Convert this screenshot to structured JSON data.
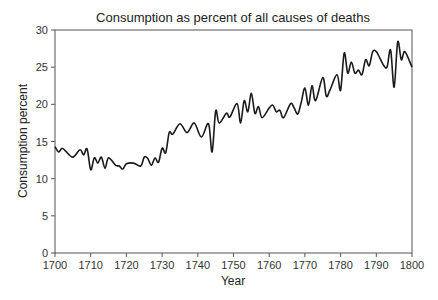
{
  "chart_data": {
    "type": "line",
    "title": "Consumption as percent of all causes of deaths",
    "xlabel": "Year",
    "ylabel": "Consumption percent",
    "xlim": [
      1700,
      1800
    ],
    "ylim": [
      0,
      30
    ],
    "xticks": [
      1700,
      1710,
      1720,
      1730,
      1740,
      1750,
      1760,
      1770,
      1780,
      1790,
      1800
    ],
    "yticks": [
      0,
      5,
      10,
      15,
      20,
      25,
      30
    ],
    "grid": false,
    "legend": null,
    "line_color": "#1a1a1a",
    "series": [
      {
        "name": "Consumption percent",
        "x": [
          1700,
          1701,
          1702,
          1703,
          1705,
          1707,
          1708,
          1709,
          1710,
          1711,
          1712,
          1713,
          1714,
          1715,
          1717,
          1718,
          1719,
          1720,
          1722,
          1724,
          1725,
          1726,
          1727,
          1728,
          1729,
          1730,
          1731,
          1732,
          1733,
          1735,
          1737,
          1739,
          1741,
          1743,
          1744,
          1745,
          1746,
          1748,
          1749,
          1751,
          1752,
          1753,
          1754,
          1755,
          1756,
          1757,
          1758,
          1760,
          1761,
          1762,
          1763,
          1764,
          1766,
          1767,
          1768,
          1769,
          1770,
          1771,
          1772,
          1773,
          1775,
          1776,
          1777,
          1779,
          1780,
          1781,
          1782,
          1783,
          1784,
          1785,
          1786,
          1787,
          1788,
          1789,
          1790,
          1791,
          1792,
          1793,
          1794,
          1795,
          1796,
          1797,
          1798,
          1800
        ],
        "values": [
          14.3,
          13.6,
          14.1,
          13.7,
          12.9,
          13.9,
          13.2,
          14.0,
          11.2,
          12.8,
          12.1,
          12.9,
          11.4,
          12.8,
          11.8,
          11.7,
          11.3,
          12.0,
          12.1,
          11.7,
          12.9,
          12.7,
          11.8,
          12.8,
          12.2,
          14.1,
          13.5,
          16.2,
          16.0,
          17.4,
          16.2,
          17.5,
          15.6,
          17.4,
          13.6,
          19.1,
          17.5,
          18.8,
          18.3,
          20.1,
          17.5,
          20.5,
          19.0,
          21.5,
          18.8,
          19.7,
          18.2,
          19.5,
          19.9,
          19.0,
          19.2,
          18.2,
          20.1,
          19.5,
          18.7,
          20.3,
          22.2,
          19.9,
          22.5,
          20.5,
          23.6,
          21.1,
          21.9,
          24.0,
          21.9,
          26.9,
          24.2,
          25.7,
          24.2,
          24.6,
          24.0,
          26.0,
          25.2,
          27.1,
          27.1,
          26.2,
          25.3,
          25.0,
          27.3,
          22.3,
          28.4,
          26.0,
          27.1,
          25.0
        ]
      }
    ]
  }
}
